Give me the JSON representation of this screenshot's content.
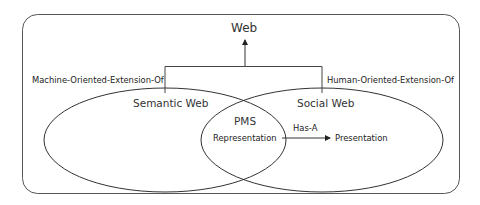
{
  "diagram": {
    "root": {
      "label": "Web"
    },
    "left_relation": {
      "label": "Machine-Oriented-Extension-Of"
    },
    "right_relation": {
      "label": "Human-Oriented-Extension-Of"
    },
    "left_set": {
      "label": "Semantic Web"
    },
    "right_set": {
      "label": "Social Web"
    },
    "intersection": {
      "title": "PMS",
      "item": "Representation"
    },
    "edge": {
      "label": "Has-A"
    },
    "target": {
      "label": "Presentation"
    },
    "colors": {
      "stroke": "#333333",
      "frame": "#555555",
      "background": "#ffffff"
    }
  }
}
